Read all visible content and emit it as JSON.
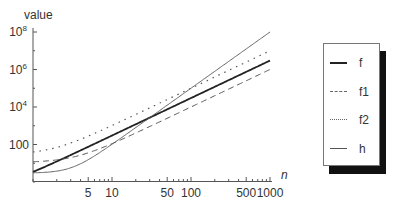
{
  "chart_data": {
    "type": "line",
    "title": "",
    "xlabel": "n",
    "ylabel": "value",
    "xscale": "log",
    "yscale": "log",
    "xlim": [
      1,
      1000
    ],
    "ylim": [
      1,
      100000000
    ],
    "x_ticks": [
      5,
      10,
      50,
      100,
      500,
      1000
    ],
    "x_tick_labels": [
      "5",
      "10",
      "50",
      "100",
      "500",
      "1000"
    ],
    "y_ticks": [
      100,
      10000,
      1000000,
      100000000
    ],
    "y_tick_labels": [
      "100",
      "10^4",
      "10^6",
      "10^8"
    ],
    "grid": false,
    "legend_position": "right",
    "x": [
      1,
      2,
      5,
      10,
      20,
      50,
      100,
      200,
      500,
      1000
    ],
    "series": [
      {
        "name": "f",
        "style": "solid-thick",
        "values": [
          3.5,
          12,
          75,
          300,
          1200,
          7500,
          30000,
          120000,
          750000,
          3000000
        ]
      },
      {
        "name": "f1",
        "style": "dashed",
        "values": [
          12,
          14,
          35,
          110,
          410,
          2510,
          10000,
          40000,
          250000,
          1000000
        ]
      },
      {
        "name": "f2",
        "style": "dotted",
        "values": [
          40,
          70,
          280,
          1000,
          4000,
          25000,
          100000,
          400000,
          2500000,
          10000000
        ]
      },
      {
        "name": "h",
        "style": "solid-thin",
        "values": [
          3.1,
          3.8,
          15.5,
          103,
          803,
          12503,
          100003,
          800003,
          12500003,
          100000003
        ]
      }
    ]
  },
  "axes": {
    "y_title": "value",
    "x_title": "n",
    "y_labels": [
      {
        "base": "10",
        "exp": "8",
        "value": 100000000
      },
      {
        "base": "10",
        "exp": "6",
        "value": 1000000
      },
      {
        "base": "10",
        "exp": "4",
        "value": 10000
      },
      {
        "base": "100",
        "exp": "",
        "value": 100
      }
    ],
    "x_labels": [
      {
        "text": "5",
        "value": 5
      },
      {
        "text": "10",
        "value": 10
      },
      {
        "text": "50",
        "value": 50
      },
      {
        "text": "100",
        "value": 100
      },
      {
        "text": "500",
        "value": 500
      },
      {
        "text": "1000",
        "value": 1000
      }
    ]
  },
  "legend": {
    "items": [
      {
        "label": "f",
        "style": "solid-thick"
      },
      {
        "label": "f1",
        "style": "dashed"
      },
      {
        "label": "f2",
        "style": "dotted"
      },
      {
        "label": "h",
        "style": "solid-thin"
      }
    ]
  },
  "colors": {
    "line": "#222222",
    "axis": "#555555",
    "shadow": "#111111"
  }
}
